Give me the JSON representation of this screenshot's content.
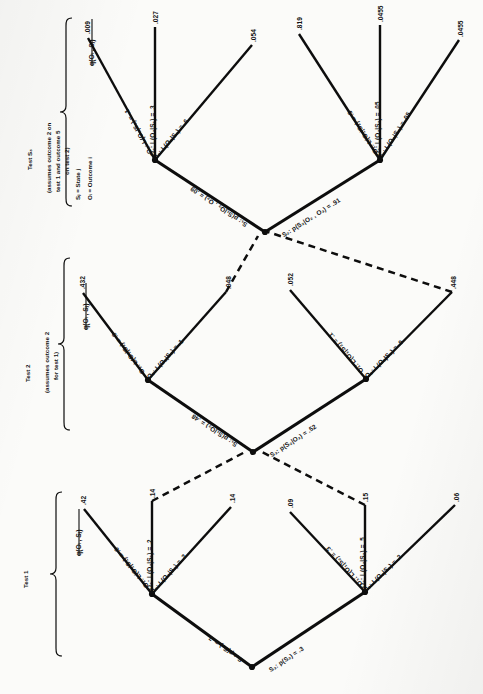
{
  "figure": {
    "type": "decision-probability-tree",
    "orientation": "rotated-90-ccw",
    "legend": {
      "state_def": "Sⱼ = State j",
      "outcome_def": "Oᵢ = Outcome i"
    },
    "sections": [
      {
        "id": "test1",
        "title": "Test 1",
        "subtitle": "",
        "column_header": "q(Oᵢ , Sⱼ)"
      },
      {
        "id": "test2",
        "title": "Test 2",
        "subtitle": "(assumes outcome 2\nfor test 1)",
        "column_header": "q(Oᵢ , Sⱼ)"
      },
      {
        "id": "test3",
        "title": "Test S₃",
        "subtitle": "(assumes outcome 2 on\ntest 1 and outcome 5\non test 2)",
        "column_header": "q(Oᵢ , Sⱼ)"
      }
    ],
    "test1": {
      "root_label": "",
      "states": [
        {
          "name": "S₁",
          "prob_label": "S₁: p(S₁) = .7",
          "branches": [
            {
              "label": "O₁: L(O₁|S₁) = .6",
              "value": ".42"
            },
            {
              "label": "O₂: L(O₂|S₁) = .2",
              "value": ".14"
            },
            {
              "label": "O₃: L(O₃|S₁) = .2",
              "value": ".14"
            }
          ]
        },
        {
          "name": "S₂",
          "prob_label": "S₂: p(S₂) = .3",
          "branches": [
            {
              "label": "O₁: L(O₁|S₂) = .3",
              "value": ".09"
            },
            {
              "label": "O₂: L(O₂|S₂) = .5",
              "value": ".15"
            },
            {
              "label": "O₃: L(O₃|S₂) = .2",
              "value": ".06"
            }
          ]
        }
      ]
    },
    "test2": {
      "states": [
        {
          "name": "S₁",
          "prob_label": "S₁: p(S₁|O₂) = .48",
          "branches": [
            {
              "label": "O₁: L(O₁|S₁) = .9",
              "value": ".432"
            },
            {
              "label": "O₂: L(O₂|S₁) = .1",
              "value": ".048"
            }
          ]
        },
        {
          "name": "S₂",
          "prob_label": "S₂: p(S₂|O₂) = .52",
          "branches": [
            {
              "label": "O₁: L(O₁|S₂) = .1",
              "value": ".052"
            },
            {
              "label": "O₂: L(O₂|S₂) = .9",
              "value": ".448"
            }
          ]
        }
      ]
    },
    "test3": {
      "states": [
        {
          "name": "S₁",
          "prob_label": "S₁: p(S₁|O₂ , O₂) = .09",
          "branches": [
            {
              "label": "O₁: L(O₁|S₁) = .1",
              "value": ".009"
            },
            {
              "label": "O₂: L(O₂|S₁) = .3",
              "value": ".027"
            },
            {
              "label": "O₃: L(O₃|S₁) = .6",
              "value": ".054"
            }
          ]
        },
        {
          "name": "S₂",
          "prob_label": "S₂: p(S₂|O₂ , O₃) = .91",
          "branches": [
            {
              "label": "O₁: L(O₁|S₂) = .9",
              "value": ".819"
            },
            {
              "label": "O₂: L(O₂|S₂) = .05",
              "value": ".0455"
            },
            {
              "label": "O₃: L(O₃|S₂) = .05",
              "value": ".0455"
            }
          ]
        }
      ]
    }
  }
}
